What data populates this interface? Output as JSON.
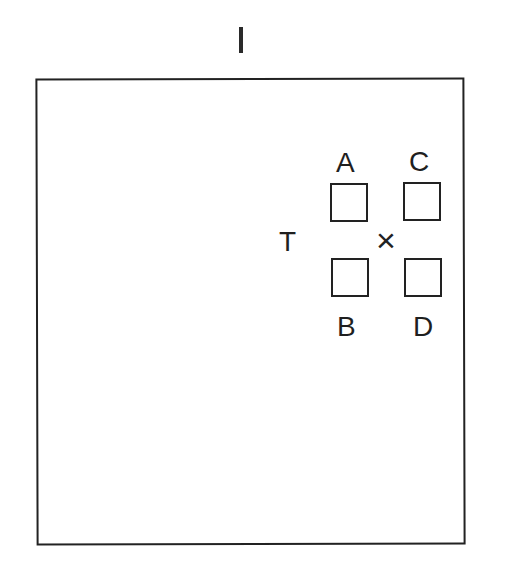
{
  "diagram": {
    "title_mark": "I",
    "fixation_label": "T",
    "center_marker": "×",
    "squares": [
      {
        "label": "A",
        "position": "upper-left"
      },
      {
        "label": "C",
        "position": "upper-right"
      },
      {
        "label": "B",
        "position": "lower-left"
      },
      {
        "label": "D",
        "position": "lower-right"
      }
    ]
  }
}
